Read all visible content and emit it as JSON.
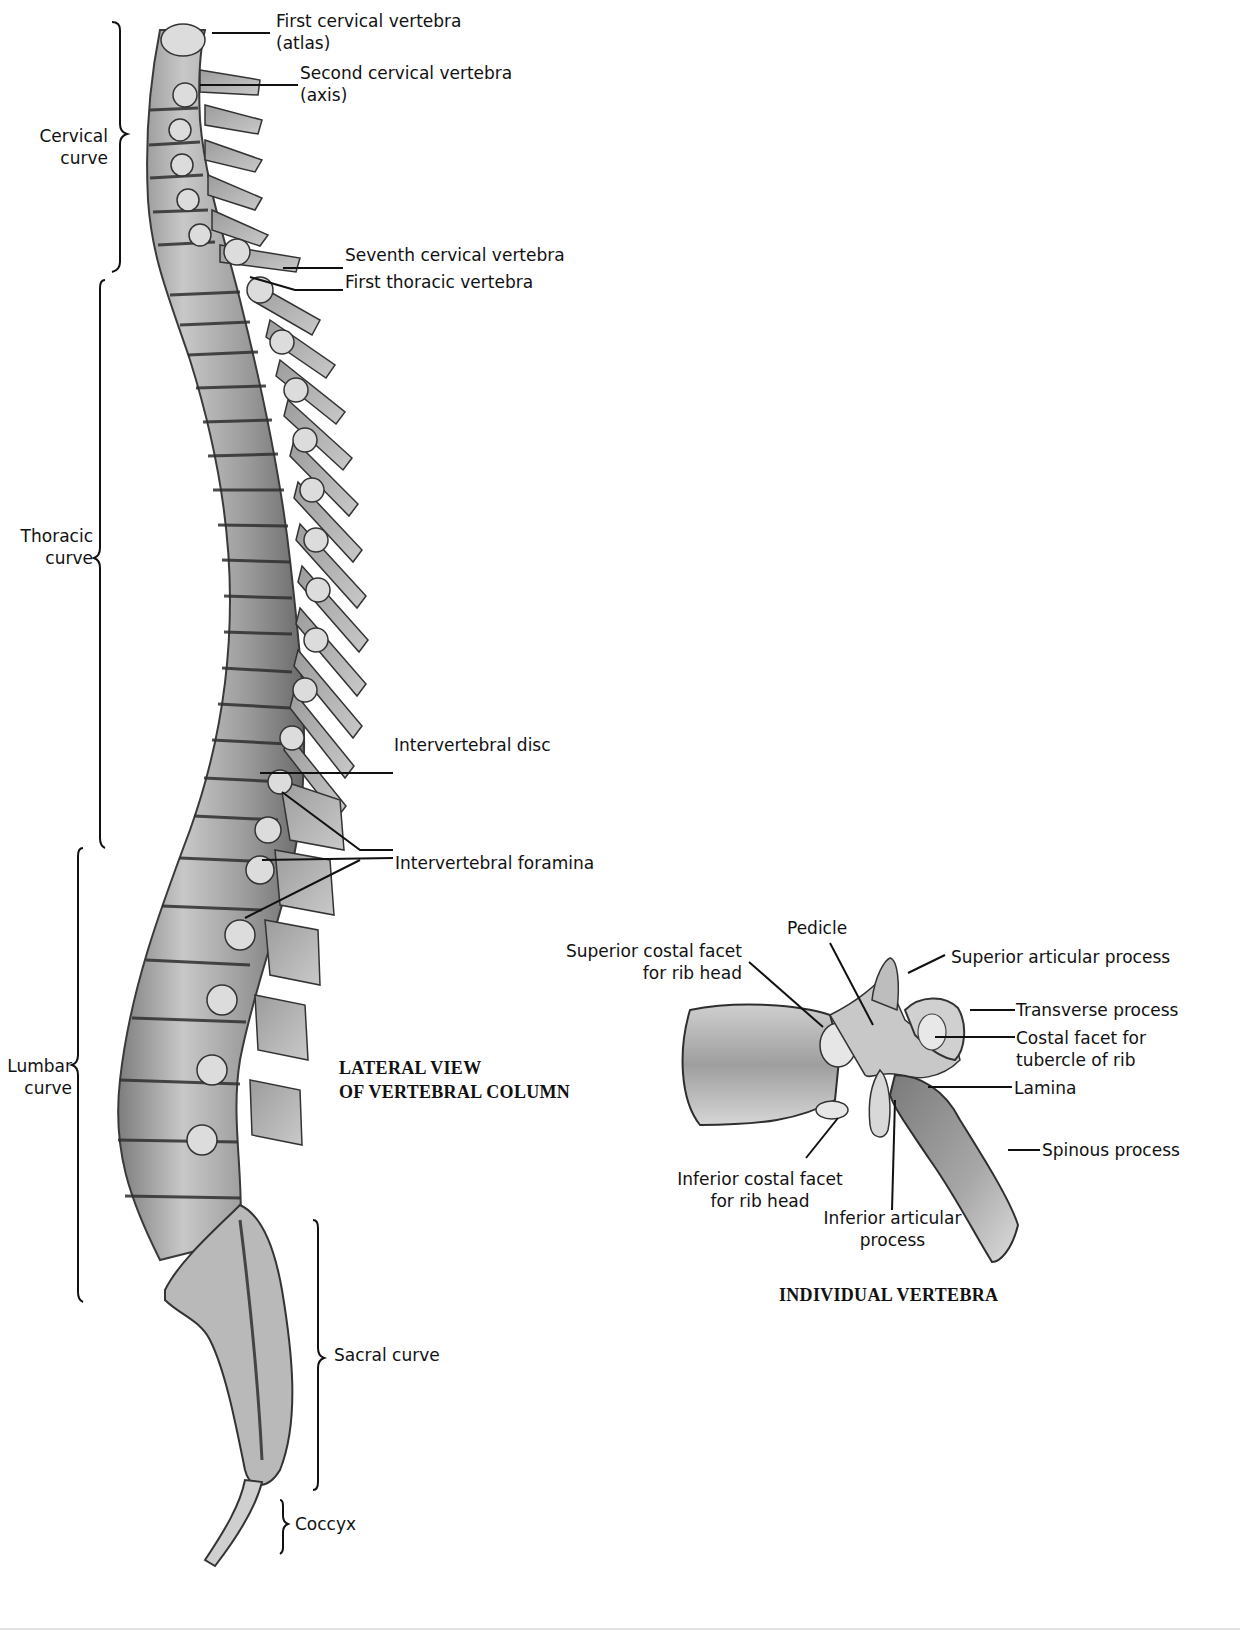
{
  "figure": {
    "lateral_view_title": [
      "LATERAL VIEW",
      "OF VERTEBRAL COLUMN"
    ],
    "individual_title": "INDIVIDUAL VERTEBRA"
  },
  "regions": [
    {
      "id": "cervical",
      "label": [
        "Cervical",
        "curve"
      ]
    },
    {
      "id": "thoracic",
      "label": [
        "Thoracic",
        "curve"
      ]
    },
    {
      "id": "lumbar",
      "label": [
        "Lumbar",
        "curve"
      ]
    },
    {
      "id": "sacral",
      "label": [
        "Sacral curve"
      ]
    },
    {
      "id": "coccyx",
      "label": [
        "Coccyx"
      ]
    }
  ],
  "column_labels": {
    "first_cervical": [
      "First cervical vertebra",
      "(atlas)"
    ],
    "second_cervical": [
      "Second cervical vertebra",
      "(axis)"
    ],
    "seventh_cervical": "Seventh cervical vertebra",
    "first_thoracic": "First thoracic vertebra",
    "intervertebral_disc": "Intervertebral disc",
    "intervertebral_foramina": "Intervertebral foramina"
  },
  "vertebra_labels": {
    "pedicle": "Pedicle",
    "superior_costal_facet": [
      "Superior costal facet",
      "for rib head"
    ],
    "superior_articular_process": "Superior articular process",
    "transverse_process": "Transverse process",
    "costal_facet_tubercle": [
      "Costal facet for",
      "tubercle of rib"
    ],
    "lamina": "Lamina",
    "spinous_process": "Spinous process",
    "inferior_costal_facet": [
      "Inferior costal facet",
      "for rib head"
    ],
    "inferior_articular_process": [
      "Inferior articular",
      "process"
    ]
  },
  "colors": {
    "bone_light": "#e8e8e8",
    "bone_mid": "#a9a9a9",
    "bone_dark": "#4a4a4a",
    "line": "#111111"
  }
}
